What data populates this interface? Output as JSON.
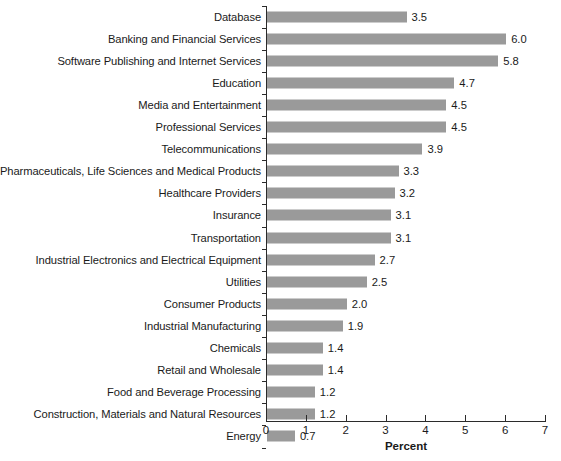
{
  "chart_data": {
    "type": "bar",
    "orientation": "horizontal",
    "title": "",
    "subtitle": "",
    "xlabel": "Percent",
    "ylabel": "",
    "xlim": [
      0,
      7
    ],
    "ylim": null,
    "grid": false,
    "legend": null,
    "xticks": [
      "0",
      "1",
      "2",
      "3",
      "4",
      "5",
      "6",
      "7"
    ],
    "xtick_values": [
      0,
      1,
      2,
      3,
      4,
      5,
      6,
      7
    ],
    "bar_color": "#9a9a9a",
    "axis_color": "#2b2b2b",
    "background_color": "#ffffff",
    "data_label_format": "one-decimal",
    "categories": [
      "Database",
      "Banking and Financial Services",
      "Software Publishing and Internet Services",
      "Education",
      "Media and Entertainment",
      "Professional Services",
      "Telecommunications",
      "Pharmaceuticals, Life Sciences and Medical Products",
      "Healthcare Providers",
      "Insurance",
      "Transportation",
      "Industrial Electronics and Electrical Equipment",
      "Utilities",
      "Consumer Products",
      "Industrial Manufacturing",
      "Chemicals",
      "Retail and Wholesale",
      "Food and Beverage Processing",
      "Construction, Materials and Natural Resources",
      "Energy"
    ],
    "values": [
      3.5,
      6.0,
      5.8,
      4.7,
      4.5,
      4.5,
      3.9,
      3.3,
      3.2,
      3.1,
      3.1,
      2.7,
      2.5,
      2.0,
      1.9,
      1.4,
      1.4,
      1.2,
      1.2,
      0.7
    ],
    "value_labels": [
      "3.5",
      "6.0",
      "5.8",
      "4.7",
      "4.5",
      "4.5",
      "3.9",
      "3.3",
      "3.2",
      "3.1",
      "3.1",
      "2.7",
      "2.5",
      "2.0",
      "1.9",
      "1.4",
      "1.4",
      "1.2",
      "1.2",
      "0.7"
    ]
  }
}
